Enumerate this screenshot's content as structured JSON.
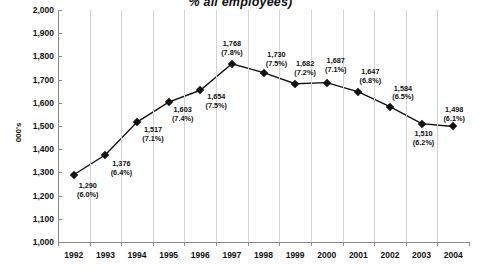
{
  "chart_data": {
    "type": "line",
    "title": "% all employees)",
    "xlabel": "",
    "ylabel": "000's",
    "categories": [
      "1992",
      "1993",
      "1994",
      "1995",
      "1996",
      "1997",
      "1998",
      "1999",
      "2000",
      "2001",
      "2002",
      "2003",
      "2004"
    ],
    "values": [
      1290,
      1376,
      1517,
      1603,
      1654,
      1768,
      1730,
      1682,
      1687,
      1647,
      1584,
      1510,
      1498
    ],
    "point_labels": [
      {
        "value": "1,290",
        "percent": "(6.0%)"
      },
      {
        "value": "1,376",
        "percent": "(6.4%)"
      },
      {
        "value": "1,517",
        "percent": "(7.1%)"
      },
      {
        "value": "1,603",
        "percent": "(7.4%)"
      },
      {
        "value": "1,654",
        "percent": "(7.5%)"
      },
      {
        "value": "1,768",
        "percent": "(7.8%)"
      },
      {
        "value": "1,730",
        "percent": "(7.5%)"
      },
      {
        "value": "1,682",
        "percent": "(7.2%)"
      },
      {
        "value": "1,687",
        "percent": "(7.1%)"
      },
      {
        "value": "1,647",
        "percent": "(6.8%)"
      },
      {
        "value": "1,584",
        "percent": "(6.5%)"
      },
      {
        "value": "1,510",
        "percent": "(6.2%)"
      },
      {
        "value": "1,498",
        "percent": "(6.1%)"
      }
    ],
    "ylim": [
      1000,
      2000
    ],
    "ytick_labels": [
      "2,000",
      "1,900",
      "1,800",
      "1,700",
      "1,600",
      "1,500",
      "1,400",
      "1,300",
      "1,200",
      "1,100",
      "1,000"
    ],
    "ytick_values": [
      2000,
      1900,
      1800,
      1700,
      1600,
      1500,
      1400,
      1300,
      1200,
      1100,
      1000
    ],
    "grid": "vertical-only",
    "legend": "none",
    "series_color": "#111111",
    "gridline_color": "#d3d3d3",
    "axis_color": "#8a8a8a",
    "marker_shape": "diamond"
  }
}
